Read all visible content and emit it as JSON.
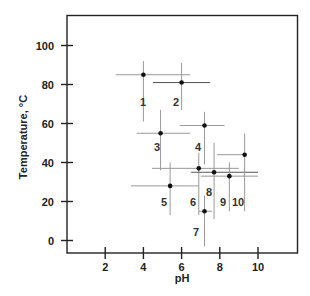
{
  "chart_data": {
    "type": "scatter",
    "title": "",
    "xlabel": "pH",
    "ylabel": "Temperature, °C",
    "xlim": [
      0,
      12
    ],
    "ylim": [
      -6,
      116
    ],
    "x_ticks": [
      2,
      4,
      6,
      8,
      10
    ],
    "y_ticks": [
      0,
      20,
      40,
      60,
      80,
      100
    ],
    "grid": false,
    "legend": null,
    "error_bars": true,
    "points": [
      {
        "label": "1",
        "pH": 4.0,
        "T": 85,
        "x_err": [
          2.55,
          6.45
        ],
        "y_err": [
          61,
          92
        ],
        "label_pos": [
          140,
          106
        ]
      },
      {
        "label": "2",
        "pH": 6.0,
        "T": 81,
        "x_err": [
          4.5,
          7.5
        ],
        "y_err": [
          67,
          91
        ],
        "label_pos": [
          173,
          106
        ]
      },
      {
        "label": "3",
        "pH": 4.9,
        "T": 55,
        "x_err": [
          3.65,
          6.45
        ],
        "y_err": [
          36,
          67
        ],
        "label_pos": [
          154,
          151
        ]
      },
      {
        "label": "4",
        "pH": 7.2,
        "T": 59,
        "x_err": [
          5.9,
          8.25
        ],
        "y_err": [
          39,
          66
        ],
        "label_pos": [
          195,
          151
        ]
      },
      {
        "label": "5",
        "pH": 5.4,
        "T": 28,
        "x_err": [
          3.35,
          6.9
        ],
        "y_err": [
          13,
          40
        ],
        "label_pos": [
          161,
          206
        ]
      },
      {
        "label": "6",
        "pH": 6.9,
        "T": 37,
        "x_err": [
          4.45,
          9.0
        ],
        "y_err": [
          13,
          45
        ],
        "label_pos": [
          190,
          206
        ]
      },
      {
        "label": "7",
        "pH": 7.2,
        "T": 15,
        "x_err": [
          6.9,
          7.6
        ],
        "y_err": [
          -3,
          23
        ],
        "label_pos": [
          193,
          236
        ]
      },
      {
        "label": "8",
        "pH": 7.7,
        "T": 35,
        "x_err": [
          6.5,
          10.0
        ],
        "y_err": [
          11,
          50
        ],
        "label_pos": [
          206,
          196
        ]
      },
      {
        "label": "9",
        "pH": 8.5,
        "T": 33,
        "x_err": [
          7.0,
          10.0
        ],
        "y_err": [
          15,
          40
        ],
        "label_pos": [
          220,
          206
        ]
      },
      {
        "label": "10",
        "pH": 9.3,
        "T": 44,
        "x_err": [
          7.85,
          9.3
        ],
        "y_err": [
          15,
          55
        ],
        "label_pos": [
          232,
          206
        ]
      }
    ]
  },
  "colors": {
    "axis": "#222222",
    "point": "#111111",
    "error_bar": "#999999",
    "error_bar_dark": "#555555"
  }
}
